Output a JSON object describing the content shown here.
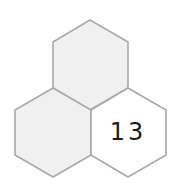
{
  "diagram": {
    "type": "hexagon-cluster",
    "cells": [
      {
        "id": "top",
        "label": "",
        "fill": "#f0f0f0"
      },
      {
        "id": "left",
        "label": "",
        "fill": "#f0f0f0"
      },
      {
        "id": "right",
        "label": "13",
        "fill": "#ffffff"
      }
    ],
    "stroke_color": "#a9a9a9"
  }
}
